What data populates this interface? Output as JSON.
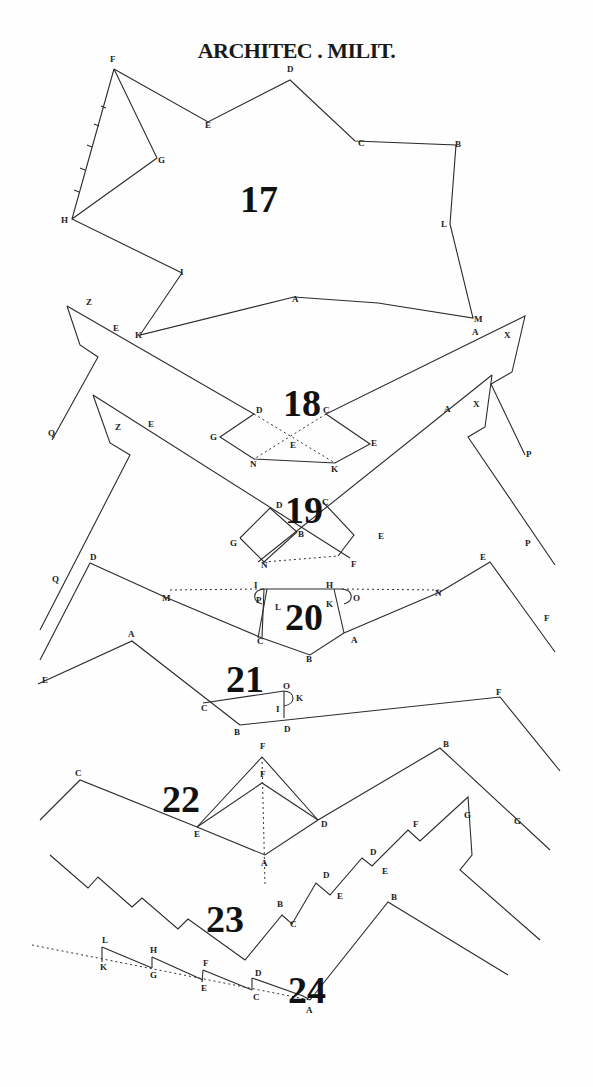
{
  "title": "ARCHITEC . MILIT.",
  "colors": {
    "ink": "#2b2b2b",
    "paper": "#fefefe"
  },
  "figures": [
    {
      "number": "17",
      "num_pos": [
        240,
        212
      ],
      "polylines": [
        [
          [
            114,
            69
          ],
          [
            208,
            122
          ],
          [
            290,
            80
          ],
          [
            355,
            141
          ],
          [
            456,
            145
          ],
          [
            450,
            224
          ],
          [
            473,
            318
          ],
          [
            378,
            303
          ],
          [
            294,
            297
          ],
          [
            140,
            335
          ],
          [
            182,
            273
          ],
          [
            72,
            219
          ],
          [
            114,
            69
          ]
        ],
        [
          [
            114,
            69
          ],
          [
            157,
            158
          ],
          [
            72,
            219
          ]
        ]
      ],
      "dotted": [],
      "labels": [
        {
          "t": "F",
          "x": 110,
          "y": 62
        },
        {
          "t": "D",
          "x": 287,
          "y": 72
        },
        {
          "t": "E",
          "x": 205,
          "y": 128
        },
        {
          "t": "C",
          "x": 358,
          "y": 146
        },
        {
          "t": "B",
          "x": 455,
          "y": 147
        },
        {
          "t": "G",
          "x": 158,
          "y": 163
        },
        {
          "t": "L",
          "x": 441,
          "y": 227
        },
        {
          "t": "H",
          "x": 61,
          "y": 223
        },
        {
          "t": "I",
          "x": 180,
          "y": 275
        },
        {
          "t": "A",
          "x": 292,
          "y": 302
        },
        {
          "t": "K",
          "x": 135,
          "y": 338
        },
        {
          "t": "M",
          "x": 474,
          "y": 322
        }
      ]
    },
    {
      "number": "18",
      "num_pos": [
        283,
        416
      ],
      "polylines": [
        [
          [
            67,
            306
          ],
          [
            80,
            345
          ],
          [
            98,
            357
          ],
          [
            52,
            440
          ]
        ],
        [
          [
            67,
            306
          ],
          [
            254,
            414
          ],
          [
            220,
            437
          ],
          [
            254,
            459
          ],
          [
            335,
            463
          ],
          [
            370,
            444
          ],
          [
            326,
            414
          ],
          [
            525,
            316
          ],
          [
            512,
            372
          ],
          [
            491,
            384
          ],
          [
            525,
            455
          ]
        ]
      ],
      "dotted": [
        [
          [
            254,
            414
          ],
          [
            335,
            463
          ]
        ],
        [
          [
            326,
            414
          ],
          [
            254,
            459
          ]
        ]
      ],
      "labels": [
        {
          "t": "Z",
          "x": 86,
          "y": 305
        },
        {
          "t": "E",
          "x": 113,
          "y": 331
        },
        {
          "t": "D",
          "x": 256,
          "y": 413
        },
        {
          "t": "C",
          "x": 323,
          "y": 413
        },
        {
          "t": "G",
          "x": 210,
          "y": 440
        },
        {
          "t": "E",
          "x": 290,
          "y": 448
        },
        {
          "t": "E",
          "x": 371,
          "y": 446
        },
        {
          "t": "N",
          "x": 250,
          "y": 467
        },
        {
          "t": "K",
          "x": 331,
          "y": 472
        },
        {
          "t": "A",
          "x": 472,
          "y": 335
        },
        {
          "t": "X",
          "x": 504,
          "y": 338
        },
        {
          "t": "Q",
          "x": 48,
          "y": 436
        },
        {
          "t": "A",
          "x": 444,
          "y": 412
        },
        {
          "t": "X",
          "x": 473,
          "y": 407
        },
        {
          "t": "P",
          "x": 526,
          "y": 457
        }
      ]
    },
    {
      "number": "19",
      "num_pos": [
        285,
        523
      ],
      "polylines": [
        [
          [
            93,
            395
          ],
          [
            110,
            443
          ],
          [
            130,
            455
          ],
          [
            40,
            630
          ]
        ],
        [
          [
            93,
            395
          ],
          [
            350,
            558
          ]
        ],
        [
          [
            492,
            375
          ],
          [
            485,
            427
          ],
          [
            468,
            437
          ],
          [
            555,
            565
          ]
        ],
        [
          [
            492,
            375
          ],
          [
            258,
            562
          ]
        ],
        [
          [
            240,
            538
          ],
          [
            270,
            508
          ],
          [
            297,
            532
          ],
          [
            264,
            562
          ],
          [
            240,
            538
          ]
        ],
        [
          [
            323,
            502
          ],
          [
            354,
            535
          ],
          [
            338,
            556
          ]
        ]
      ],
      "dotted": [
        [
          [
            264,
            562
          ],
          [
            338,
            556
          ]
        ]
      ],
      "labels": [
        {
          "t": "Z",
          "x": 115,
          "y": 430
        },
        {
          "t": "E",
          "x": 148,
          "y": 427
        },
        {
          "t": "D",
          "x": 276,
          "y": 508
        },
        {
          "t": "C",
          "x": 322,
          "y": 505
        },
        {
          "t": "G",
          "x": 230,
          "y": 546
        },
        {
          "t": "B",
          "x": 298,
          "y": 537
        },
        {
          "t": "E",
          "x": 378,
          "y": 539
        },
        {
          "t": "N",
          "x": 261,
          "y": 568
        },
        {
          "t": "F",
          "x": 351,
          "y": 567
        },
        {
          "t": "P",
          "x": 525,
          "y": 546
        },
        {
          "t": "Q",
          "x": 52,
          "y": 582
        }
      ]
    },
    {
      "number": "20",
      "num_pos": [
        285,
        630
      ],
      "polylines": [
        [
          [
            90,
            563
          ],
          [
            165,
            597
          ],
          [
            262,
            638
          ],
          [
            310,
            655
          ],
          [
            344,
            633
          ],
          [
            440,
            592
          ],
          [
            490,
            562
          ],
          [
            555,
            652
          ]
        ],
        [
          [
            90,
            563
          ],
          [
            40,
            660
          ]
        ],
        [
          [
            264,
            589
          ],
          [
            262,
            638
          ]
        ],
        [
          [
            267,
            589
          ],
          [
            258,
            638
          ]
        ],
        [
          [
            262,
            589
          ],
          [
            342,
            589
          ]
        ],
        [
          [
            334,
            589
          ],
          [
            344,
            633
          ]
        ]
      ],
      "dotted": [
        [
          [
            170,
            590
          ],
          [
            262,
            589
          ]
        ],
        [
          [
            342,
            589
          ],
          [
            440,
            590
          ]
        ]
      ],
      "labels": [
        {
          "t": "D",
          "x": 90,
          "y": 560
        },
        {
          "t": "M",
          "x": 162,
          "y": 601
        },
        {
          "t": "I",
          "x": 254,
          "y": 588
        },
        {
          "t": "H",
          "x": 326,
          "y": 588
        },
        {
          "t": "P",
          "x": 256,
          "y": 603
        },
        {
          "t": "L",
          "x": 275,
          "y": 610
        },
        {
          "t": "K",
          "x": 326,
          "y": 607
        },
        {
          "t": "O",
          "x": 353,
          "y": 601
        },
        {
          "t": "C",
          "x": 257,
          "y": 644
        },
        {
          "t": "A",
          "x": 351,
          "y": 643
        },
        {
          "t": "B",
          "x": 306,
          "y": 662
        },
        {
          "t": "N",
          "x": 435,
          "y": 596
        },
        {
          "t": "E",
          "x": 480,
          "y": 560
        },
        {
          "t": "F",
          "x": 544,
          "y": 621
        },
        {
          "t": "E",
          "x": 42,
          "y": 683
        }
      ]
    },
    {
      "number": "21",
      "num_pos": [
        226,
        692
      ],
      "polylines": [
        [
          [
            38,
            684
          ],
          [
            132,
            641
          ],
          [
            240,
            725
          ]
        ],
        [
          [
            203,
            703
          ],
          [
            284,
            691
          ]
        ],
        [
          [
            284,
            691
          ],
          [
            284,
            718
          ]
        ],
        [
          [
            240,
            725
          ],
          [
            500,
            697
          ],
          [
            560,
            771
          ]
        ]
      ],
      "dotted": [],
      "labels": [
        {
          "t": "A",
          "x": 128,
          "y": 637
        },
        {
          "t": "C",
          "x": 201,
          "y": 711
        },
        {
          "t": "O",
          "x": 283,
          "y": 689
        },
        {
          "t": "K",
          "x": 296,
          "y": 701
        },
        {
          "t": "I",
          "x": 276,
          "y": 712
        },
        {
          "t": "B",
          "x": 234,
          "y": 735
        },
        {
          "t": "D",
          "x": 284,
          "y": 732
        },
        {
          "t": "F",
          "x": 496,
          "y": 695
        }
      ]
    },
    {
      "number": "22",
      "num_pos": [
        162,
        812
      ],
      "polylines": [
        [
          [
            40,
            820
          ],
          [
            80,
            780
          ],
          [
            197,
            827
          ],
          [
            265,
            855
          ],
          [
            318,
            820
          ],
          [
            440,
            748
          ],
          [
            550,
            850
          ]
        ],
        [
          [
            197,
            827
          ],
          [
            262,
            757
          ],
          [
            318,
            820
          ]
        ],
        [
          [
            197,
            827
          ],
          [
            262,
            783
          ],
          [
            318,
            820
          ]
        ]
      ],
      "dotted": [
        [
          [
            262,
            757
          ],
          [
            265,
            885
          ]
        ]
      ],
      "labels": [
        {
          "t": "C",
          "x": 75,
          "y": 776
        },
        {
          "t": "F",
          "x": 260,
          "y": 749
        },
        {
          "t": "F",
          "x": 260,
          "y": 777
        },
        {
          "t": "E",
          "x": 194,
          "y": 837
        },
        {
          "t": "D",
          "x": 321,
          "y": 827
        },
        {
          "t": "A",
          "x": 261,
          "y": 866
        },
        {
          "t": "B",
          "x": 443,
          "y": 747
        },
        {
          "t": "G",
          "x": 514,
          "y": 824
        }
      ]
    },
    {
      "number": "23",
      "num_pos": [
        206,
        932
      ],
      "polylines": [
        [
          [
            50,
            855
          ],
          [
            88,
            888
          ],
          [
            98,
            877
          ],
          [
            132,
            907
          ],
          [
            142,
            898
          ],
          [
            178,
            929
          ],
          [
            188,
            919
          ],
          [
            245,
            960
          ],
          [
            282,
            915
          ],
          [
            292,
            924
          ],
          [
            316,
            883
          ],
          [
            330,
            895
          ],
          [
            362,
            858
          ],
          [
            372,
            866
          ],
          [
            408,
            830
          ],
          [
            420,
            841
          ],
          [
            468,
            797
          ],
          [
            472,
            855
          ],
          [
            460,
            870
          ],
          [
            540,
            940
          ]
        ]
      ],
      "dotted": [],
      "labels": [
        {
          "t": "B",
          "x": 277,
          "y": 907
        },
        {
          "t": "C",
          "x": 290,
          "y": 927
        },
        {
          "t": "D",
          "x": 323,
          "y": 878
        },
        {
          "t": "E",
          "x": 337,
          "y": 899
        },
        {
          "t": "D",
          "x": 370,
          "y": 855
        },
        {
          "t": "E",
          "x": 382,
          "y": 874
        },
        {
          "t": "F",
          "x": 413,
          "y": 827
        },
        {
          "t": "G",
          "x": 464,
          "y": 818
        }
      ]
    },
    {
      "number": "24",
      "num_pos": [
        288,
        1003
      ],
      "polylines": [
        [
          [
            102,
            947
          ],
          [
            102,
            962
          ]
        ],
        [
          [
            102,
            947
          ],
          [
            152,
            968
          ]
        ],
        [
          [
            152,
            957
          ],
          [
            152,
            968
          ]
        ],
        [
          [
            152,
            957
          ],
          [
            203,
            980
          ]
        ],
        [
          [
            203,
            970
          ],
          [
            202,
            982
          ]
        ],
        [
          [
            203,
            970
          ],
          [
            252,
            990
          ]
        ],
        [
          [
            252,
            978
          ],
          [
            252,
            990
          ]
        ],
        [
          [
            252,
            978
          ],
          [
            303,
            996
          ],
          [
            310,
            1000
          ]
        ],
        [
          [
            310,
            1000
          ],
          [
            388,
            902
          ],
          [
            508,
            975
          ]
        ]
      ],
      "dotted": [
        [
          [
            32,
            945
          ],
          [
            310,
            1000
          ]
        ]
      ],
      "labels": [
        {
          "t": "L",
          "x": 102,
          "y": 943
        },
        {
          "t": "K",
          "x": 100,
          "y": 970
        },
        {
          "t": "H",
          "x": 150,
          "y": 953
        },
        {
          "t": "G",
          "x": 150,
          "y": 978
        },
        {
          "t": "F",
          "x": 203,
          "y": 966
        },
        {
          "t": "E",
          "x": 201,
          "y": 991
        },
        {
          "t": "D",
          "x": 255,
          "y": 976
        },
        {
          "t": "C",
          "x": 253,
          "y": 1000
        },
        {
          "t": "A",
          "x": 306,
          "y": 1013
        },
        {
          "t": "B",
          "x": 391,
          "y": 900
        }
      ]
    }
  ]
}
